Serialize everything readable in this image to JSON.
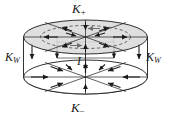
{
  "figure": {
    "kind": "surface-current-cylinder-diagram",
    "background_color": "#ffffff",
    "stroke_color": "#1a1a1a",
    "top_disk_fill": "#d9d9d9",
    "bottom_disk_fill": "#ffffff",
    "dashed_ellipse_color": "#555555",
    "labels": {
      "top_cap": {
        "symbol": "K",
        "subscript": "+",
        "text": "K+"
      },
      "bottom_cap": {
        "symbol": "K",
        "subscript": "−",
        "text": "K−"
      },
      "wall_left": {
        "symbol": "K",
        "subscript": "W",
        "text": "KW"
      },
      "wall_right": {
        "symbol": "K",
        "subscript": "W",
        "text": "KW"
      },
      "axis_current": {
        "symbol": "I",
        "subscript": "",
        "text": "I"
      }
    },
    "geometry": {
      "top_ellipse": {
        "cx": 85.5,
        "cy": 37,
        "rx": 62,
        "ry": 17
      },
      "top_inner_ellipse": {
        "cx": 85.5,
        "cy": 37,
        "rx": 45,
        "ry": 11.5
      },
      "bottom_ellipse": {
        "cx": 85.5,
        "cy": 77,
        "rx": 62,
        "ry": 17
      },
      "wall_height": 40,
      "axis_x": 85.5
    },
    "arrow_semantics": {
      "top_cap": "radially inward toward axis",
      "bottom_cap": "radially inward toward axis",
      "wall": "downward along the side wall",
      "axis": "upward along the central axis"
    }
  }
}
